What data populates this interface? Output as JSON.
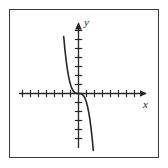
{
  "figure": {
    "frame": {
      "visible": true,
      "border_color": "#3a3a3a",
      "background_color": "#ffffff"
    },
    "x_axis_label": "x",
    "y_axis_label": "y",
    "x_axis_label_name": "x-axis-label",
    "y_axis_label_name": "y-axis-label"
  },
  "chart_data": {
    "type": "line",
    "title": "",
    "subtitle": "",
    "xlabel": "x",
    "ylabel": "y",
    "xlim": [
      -7.5,
      7.5
    ],
    "ylim": [
      -7.5,
      7.5
    ],
    "grid": false,
    "legend": null,
    "legend_position": "none",
    "axes_style": "arrow-tipped cartesian axes with unit tick marks",
    "x_ticks": [
      -7,
      -6,
      -5,
      -4,
      -3,
      -2,
      -1,
      1,
      2,
      3,
      4,
      5,
      6,
      7
    ],
    "y_ticks": [
      -6,
      -5,
      -4,
      -3,
      -2,
      -1,
      1,
      2,
      3,
      4,
      5,
      6
    ],
    "tick_labels_shown": false,
    "series": [
      {
        "name": "y = -x^3",
        "color": "#262626",
        "line_width": 1.6,
        "x": [
          -1.85,
          -1.7,
          -1.55,
          -1.4,
          -1.25,
          -1.1,
          -0.95,
          -0.8,
          -0.65,
          -0.5,
          -0.35,
          -0.2,
          0,
          0.2,
          0.35,
          0.5,
          0.65,
          0.8,
          0.95,
          1.1,
          1.25,
          1.4,
          1.55,
          1.7,
          1.85
        ],
        "y": [
          6.33,
          4.91,
          3.72,
          2.74,
          1.95,
          1.33,
          0.86,
          0.51,
          0.27,
          0.13,
          0.04,
          0.01,
          0,
          -0.01,
          -0.04,
          -0.13,
          -0.27,
          -0.51,
          -0.86,
          -1.33,
          -1.95,
          -2.74,
          -3.72,
          -4.91,
          -6.33
        ]
      }
    ],
    "annotations": []
  }
}
